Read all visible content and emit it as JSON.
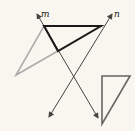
{
  "diagram": {
    "background": "#f8f6ee",
    "lines": [
      {
        "name": "m",
        "label": "m",
        "from": [
          37,
          14
        ],
        "to": [
          98,
          118
        ],
        "color": "#444444",
        "arrows": "both"
      },
      {
        "name": "n",
        "label": "n",
        "from": [
          112,
          14
        ],
        "to": [
          49,
          117
        ],
        "color": "#444444",
        "arrows": "both"
      }
    ],
    "triangles": [
      {
        "name": "black-triangle",
        "points": [
          [
            44,
            26
          ],
          [
            101,
            26
          ],
          [
            58,
            51
          ]
        ],
        "color": "#1a1a1a"
      },
      {
        "name": "gray-triangle",
        "points": [
          [
            44,
            26
          ],
          [
            58,
            51
          ],
          [
            16,
            75
          ]
        ],
        "color": "#aaaaaa"
      },
      {
        "name": "small-right-triangle",
        "points": [
          [
            102,
            76
          ],
          [
            130,
            76
          ],
          [
            102,
            124
          ]
        ],
        "color": "#666666"
      }
    ],
    "labels": {
      "m": "m",
      "n": "n"
    }
  }
}
